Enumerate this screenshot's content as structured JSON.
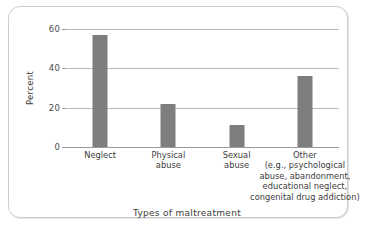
{
  "chart_data": {
    "type": "bar",
    "title": "",
    "xlabel": "Types of maltreatment",
    "ylabel": "Percent",
    "categories": [
      "Neglect",
      "Physical abuse",
      "Sexual abuse",
      "Other (e.g., psychological abuse, abandonment, educational neglect, congenital drug addiction)"
    ],
    "category_lines": [
      [
        "Neglect"
      ],
      [
        "Physical",
        "abuse"
      ],
      [
        "Sexual",
        "abuse"
      ],
      [
        "Other",
        "(e.g., psychological",
        "abuse, abandonment,",
        "educational neglect,",
        "congenital drug addiction)"
      ]
    ],
    "values": [
      57,
      22,
      11,
      36
    ],
    "ylim": [
      0,
      60
    ],
    "yticks": [
      0,
      20,
      40,
      60
    ],
    "ytick_labels": [
      "0",
      "20",
      "40",
      "60"
    ],
    "grid": true,
    "legend": "none",
    "bar_color": "#7e7e7e",
    "gridline_color": "#b9b9b9",
    "axis_color": "#9a9a9a",
    "frame_color": "#cdcdcd"
  }
}
